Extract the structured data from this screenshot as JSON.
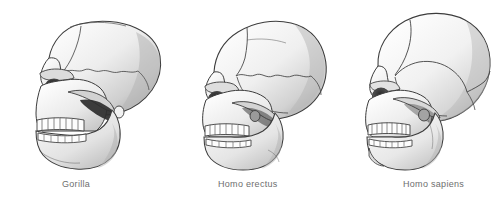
{
  "figure": {
    "background_color": "#ffffff",
    "width": 501,
    "height": 199,
    "style": "grayscale pen-and-ink scientific illustration",
    "view": "left lateral profile, facing left"
  },
  "palette": {
    "outline": "#3c3c3c",
    "suture": "#4a4a4a",
    "bone_light": "#fbfbfb",
    "bone_mid": "#e4e4e4",
    "bone_shadow": "#b9b9b9",
    "cavity_dark": "#2a2a2a",
    "cavity_mid": "#6b6b6b",
    "tooth": "#fdfdfd",
    "caption_text": "#6e6e6e"
  },
  "specimens": [
    {
      "id": "gorilla",
      "label": "Gorilla",
      "caption_x": 62,
      "caption_y": 179,
      "panel_x": 18,
      "panel_width": 150,
      "traits": [
        "small braincase",
        "prominent sagittal crest",
        "heavy supraorbital torus",
        "strong prognathism",
        "large canines",
        "deep robust mandible"
      ]
    },
    {
      "id": "homo-erectus",
      "label": "Homo erectus",
      "caption_x": 218,
      "caption_y": 179,
      "panel_x": 190,
      "panel_width": 145,
      "traits": [
        "intermediate braincase",
        "pronounced brow ridge",
        "receding forehead",
        "low elongated vault",
        "moderate prognathism",
        "no chin"
      ]
    },
    {
      "id": "homo-sapiens",
      "label": "Homo sapiens",
      "caption_x": 403,
      "caption_y": 179,
      "panel_x": 352,
      "panel_width": 145,
      "traits": [
        "large globular braincase",
        "vertical forehead",
        "reduced brow ridge",
        "orthognathic face",
        "small dentition",
        "distinct chin"
      ]
    }
  ]
}
